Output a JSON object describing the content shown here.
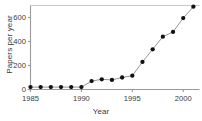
{
  "chart_data": {
    "type": "line",
    "title": "",
    "xlabel": "Year",
    "ylabel": "Papers per year",
    "xlim": [
      1985,
      2001.6
    ],
    "ylim": [
      0,
      700
    ],
    "grid": false,
    "legend": null,
    "x": [
      1985,
      1986,
      1987,
      1988,
      1989,
      1990,
      1991,
      1992,
      1993,
      1994,
      1995,
      1996,
      1997,
      1998,
      1999,
      2000,
      2001
    ],
    "values": [
      20,
      20,
      20,
      20,
      20,
      20,
      70,
      85,
      80,
      100,
      115,
      230,
      335,
      440,
      480,
      595,
      690
    ],
    "series": [
      {
        "name": "Papers per year",
        "values": [
          20,
          20,
          20,
          20,
          20,
          20,
          70,
          85,
          80,
          100,
          115,
          230,
          335,
          440,
          480,
          595,
          690
        ]
      }
    ],
    "xticks": [
      1985,
      1990,
      1995,
      2000
    ],
    "xtick_labels": [
      "1985",
      "1990",
      "1995",
      "2000"
    ],
    "yticks": [
      0,
      200,
      400,
      600
    ],
    "ytick_labels": [
      "0",
      "200",
      "400",
      "600"
    ],
    "marker": "filled-circle",
    "marker_color": "#111111",
    "line_color": "#8a8a8a",
    "axis_color": "#9a9a9a",
    "frame_top_color": "#c8c8c8",
    "background_color": "#ffffff"
  }
}
